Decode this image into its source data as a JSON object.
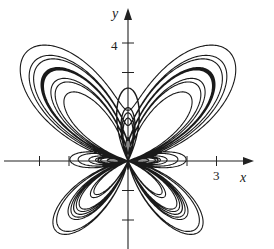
{
  "chart_data": {
    "type": "line",
    "title": "",
    "curve": "butterfly polar curve r = e^(sin θ) − 2cos(4θ) + sin^5((2θ − π)/24)",
    "xlabel": "x",
    "ylabel": "y",
    "x_tick_labels": [
      {
        "value": 3,
        "label": "3"
      }
    ],
    "y_tick_labels": [
      {
        "value": 4,
        "label": "4"
      }
    ],
    "x_ticks": [
      -3,
      -2,
      2,
      3
    ],
    "y_ticks": [
      -2,
      -1,
      3,
      4
    ],
    "xlim": [
      -4.3,
      4.2
    ],
    "ylim": [
      -3,
      5.1
    ],
    "theta_range": [
      0,
      75.4
    ],
    "grid": false,
    "legend": null,
    "colors": {
      "curve": "#1a1a1a",
      "axis": "#222222"
    },
    "layout": {
      "origin_px": [
        128,
        161
      ],
      "scale_px_per_unit": 29.5
    }
  },
  "labels": {
    "x_axis": "x",
    "y_axis": "y",
    "x_tick": "3",
    "y_tick": "4"
  }
}
